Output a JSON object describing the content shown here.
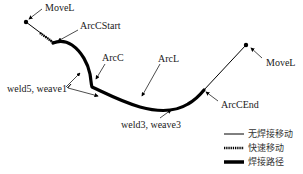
{
  "diagram": {
    "type": "welding-path",
    "labels": {
      "movel_start": "MoveL",
      "arccstart": "ArcCStart",
      "arcc": "ArcC",
      "arcl": "ArcL",
      "movel_end": "MoveL",
      "weld5_weave1": "weld5, weave1",
      "weld3_weave3": "weld3, weave3",
      "arccend": "ArcCEnd"
    },
    "legend": [
      {
        "style": "thin-line",
        "label": "无焊接移动"
      },
      {
        "style": "cross-hatched",
        "label": "快速移动"
      },
      {
        "style": "thick-line",
        "label": "焊接路径"
      }
    ],
    "colors": {
      "path": "#000000",
      "text": "#1a1a1a",
      "background": "#ffffff"
    }
  }
}
